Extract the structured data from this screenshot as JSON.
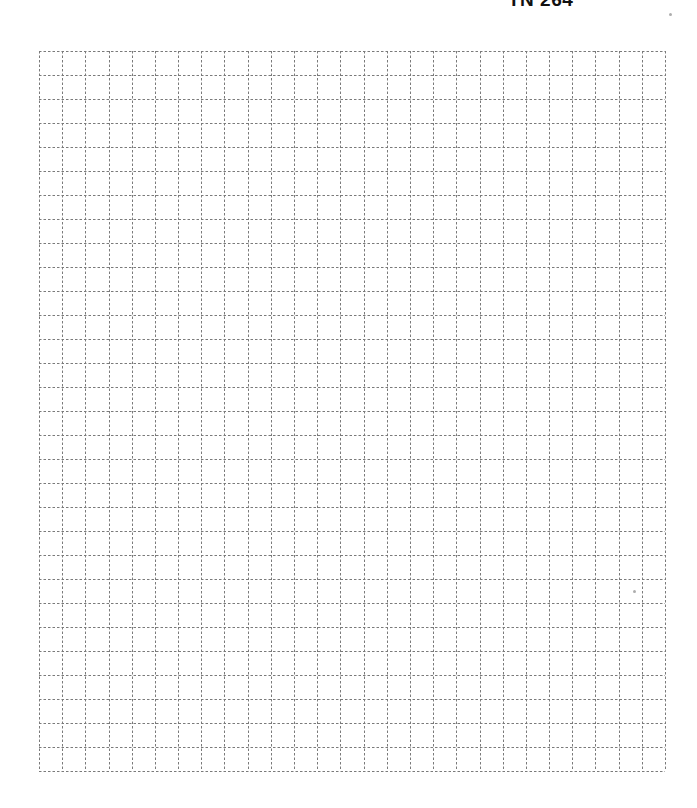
{
  "header": {
    "label": "TN 264"
  },
  "grid": {
    "columns": 27,
    "rows": 30,
    "cell_width": 23.185,
    "cell_height": 24,
    "left": 39,
    "top": 51,
    "width": 626,
    "height": 720,
    "line_color": "#7a7a7a",
    "line_style": "dashed",
    "dash_pattern": "2.5,2"
  },
  "colors": {
    "background": "#ffffff",
    "header_text": "#111111"
  }
}
